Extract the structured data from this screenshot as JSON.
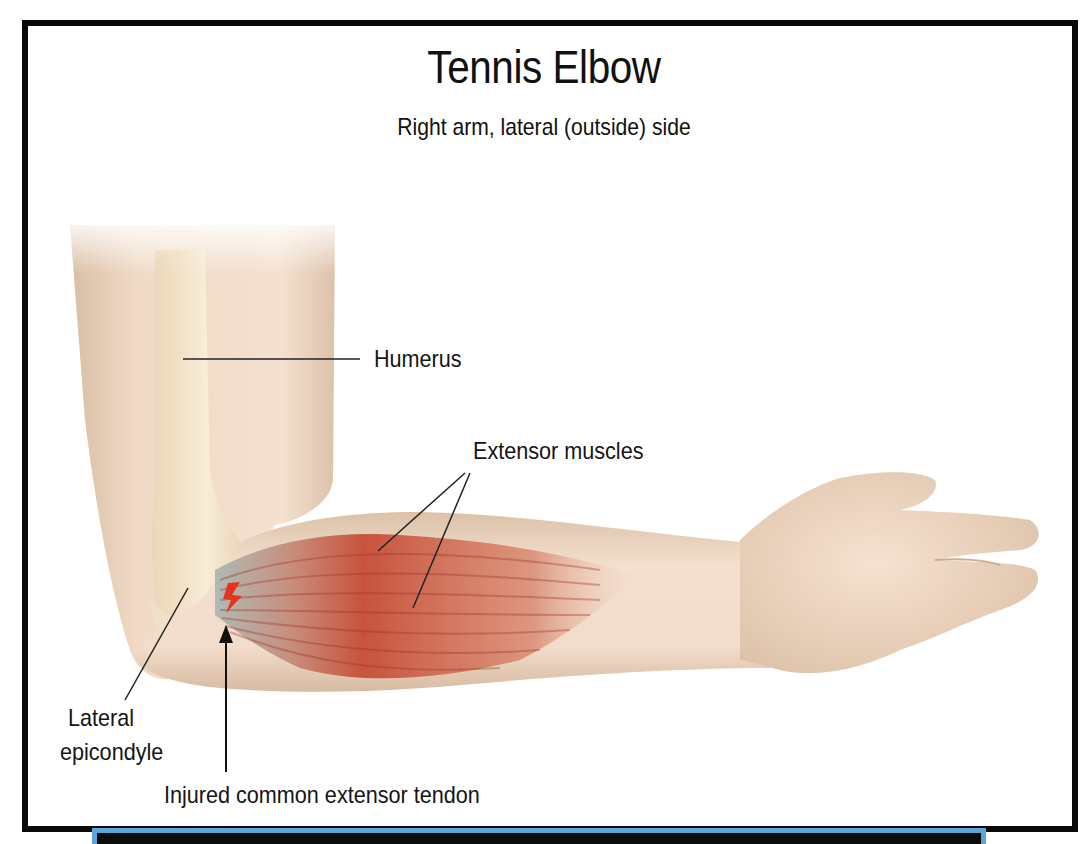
{
  "figure": {
    "title": "Tennis Elbow",
    "subtitle": "Right arm, lateral (outside) side"
  },
  "labels": {
    "humerus": "Humerus",
    "extensor_muscles": "Extensor muscles",
    "lateral_epicondyle_line1": "Lateral",
    "lateral_epicondyle_line2": "epicondyle",
    "injured_tendon": "Injured common extensor tendon"
  },
  "icons": {
    "injury_marker": "lightning-bolt-icon",
    "tendon_pointer": "arrow-up-icon"
  },
  "colors": {
    "frame": "#0a0a0a",
    "skin": "#f1d9c4",
    "skin_shadow": "#d9bea5",
    "bone": "#efe1c3",
    "muscle": "#c8503a",
    "tendon": "#a9b8b4",
    "injury": "#e8321e",
    "strip_border": "#5aa6d6",
    "strip_fill": "#0b0b0b"
  }
}
